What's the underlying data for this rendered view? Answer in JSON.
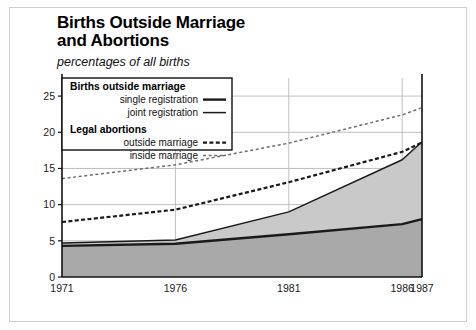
{
  "chart_data": {
    "type": "area",
    "title": "Births Outside Marriage and Abortions",
    "title_line1": "Births Outside Marriage",
    "title_line2": "and Abortions",
    "subtitle": "percentages of all births",
    "xlabel": "",
    "ylabel": "",
    "ylim": [
      0,
      27.5
    ],
    "xlim": [
      1971,
      1987
    ],
    "grid": true,
    "x": [
      1971,
      1976,
      1981,
      1986,
      1987
    ],
    "xticklabels": [
      "1971",
      "1976",
      "1981",
      "1986",
      "1987"
    ],
    "yticks": [
      0,
      5,
      10,
      15,
      20,
      25
    ],
    "yticklabels": [
      "0",
      "5",
      "10",
      "15",
      "20",
      "25"
    ],
    "legend_position": "upper-left-inside",
    "series": [
      {
        "name": "single registration",
        "group": "Births outside marriage",
        "style": "solid-thick",
        "color": "#1a1a1a",
        "fill": "#a9a9a9",
        "values": [
          4.3,
          4.6,
          5.9,
          7.3,
          8.0
        ]
      },
      {
        "name": "joint registration",
        "group": "Births outside marriage",
        "style": "solid-thin",
        "color": "#1a1a1a",
        "fill": "#c9c9c9",
        "values": [
          4.7,
          5.1,
          9.0,
          16.2,
          18.7
        ],
        "note": "cumulative total of births outside marriage"
      },
      {
        "name": "outside marriage",
        "group": "Legal abortions",
        "style": "dashed-bold",
        "color": "#1a1a1a",
        "values": [
          7.6,
          9.3,
          13.1,
          17.3,
          18.6
        ]
      },
      {
        "name": "inside marriage",
        "group": "Legal abortions",
        "style": "dashed-light",
        "color": "#6e6e6e",
        "values": [
          13.6,
          15.5,
          18.5,
          22.4,
          23.4
        ]
      }
    ]
  },
  "legend": {
    "groups": [
      {
        "heading": "Births outside marriage",
        "items": [
          {
            "label": "single registration",
            "sample": "solid-thick"
          },
          {
            "label": "joint registration",
            "sample": "solid-thin"
          }
        ]
      },
      {
        "heading": "Legal abortions",
        "items": [
          {
            "label": "outside marriage",
            "sample": "dashed-bold"
          },
          {
            "label": "inside marriage",
            "sample": "dashed-light"
          }
        ]
      }
    ]
  },
  "colors": {
    "fill_lower": "#a9a9a9",
    "fill_upper": "#c9c9c9",
    "line": "#1a1a1a",
    "grid": "#b8b8b8",
    "frame": "#cfcfcf",
    "background": "#ffffff"
  }
}
